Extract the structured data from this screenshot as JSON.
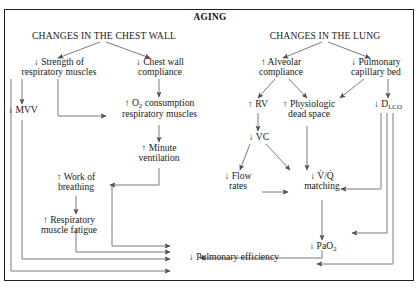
{
  "diagram": {
    "title": "AGING",
    "type": "flowchart",
    "headings": {
      "left": "CHANGES IN THE CHEST WALL",
      "right": "CHANGES IN THE LUNG"
    },
    "nodes": {
      "strength": "↓ Strength of\nrespiratory muscles",
      "chest_wall_compliance": "↓ Chest wall\ncompliance",
      "mvv": "↓ MVV",
      "o2_consumption": "↑ O₂ consumption\nrespiratory muscles",
      "minute_ventilation": "↑ Minute\nventilation",
      "work_of_breathing": "↑ Work of\nbreathing",
      "muscle_fatigue": "↑ Respiratory\nmuscle fatigue",
      "alveolar_compliance": "↑ Alveolar\ncompliance",
      "pulmonary_capillary_bed": "↓ Pulmonary\ncapillary bed",
      "rv": "↑ RV",
      "physiologic_dead_space": "↑ Physiologic\ndead space",
      "dlco": "↓ Dʟᴄᴏ",
      "vc": "↓ VC",
      "flow_rates": "↓ Flow\nrates",
      "vq_matching": "↓ V̇/Q̇\nmatching",
      "pao2": "↓ PaO₂",
      "pulmonary_efficiency": "↓ Pulmonary efficiency"
    },
    "node_lines": {
      "strength_1": "↓ Strength of",
      "strength_2": "respiratory muscles",
      "chest_wall_compliance_1": "↓ Chest wall",
      "chest_wall_compliance_2": "compliance",
      "mvv_1": "↓ MVV",
      "o2_consumption_1": "↑ O",
      "o2_consumption_sub": "2",
      "o2_consumption_1b": " consumption",
      "o2_consumption_2": "respiratory muscles",
      "minute_ventilation_1": "↑ Minute",
      "minute_ventilation_2": "ventilation",
      "work_of_breathing_1": "↑ Work of",
      "work_of_breathing_2": "breathing",
      "muscle_fatigue_1": "↑ Respiratory",
      "muscle_fatigue_2": "muscle fatigue",
      "alveolar_compliance_1": "↑ Alveolar",
      "alveolar_compliance_2": "compliance",
      "pulmonary_capillary_bed_1": "↓ Pulmonary",
      "pulmonary_capillary_bed_2": "capillary bed",
      "rv_1": "↑ RV",
      "physiologic_dead_space_1": "↑ Physiologic",
      "physiologic_dead_space_2": "dead space",
      "dlco_1": "↓ D",
      "dlco_sub": "LCO",
      "vc_1": "↓ VC",
      "flow_rates_1": "↓ Flow",
      "flow_rates_2": "rates",
      "vq_1": "↓ V̇/Q̇",
      "vq_2": "matching",
      "pao2_1": "↓ PaO",
      "pao2_sub": "2",
      "pulmonary_efficiency_1": "↓ Pulmonary efficiency"
    },
    "colors": {
      "ink": "#231f20",
      "line": "#4d4d4d",
      "background": "#ffffff"
    }
  }
}
